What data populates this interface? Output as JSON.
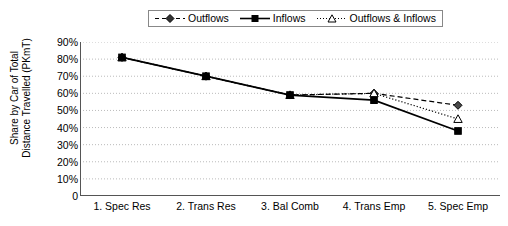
{
  "chart_data": {
    "type": "line",
    "title": "",
    "xlabel": "",
    "ylabel": "Share by Car of Total Distance Travelled (PKmT)",
    "ylabel_line1": "Share by Car of Total",
    "ylabel_line2": "Distance Travelled (PKmT)",
    "categories": [
      "1. Spec Res",
      "2. Trans Res",
      "3. Bal Comb",
      "4. Trans Emp",
      "5. Spec Emp"
    ],
    "ylim": [
      0,
      90
    ],
    "ytick_labels": [
      "0",
      "10%",
      "20%",
      "30%",
      "40%",
      "50%",
      "60%",
      "70%",
      "80%",
      "90%"
    ],
    "ytick_values": [
      0,
      10,
      20,
      30,
      40,
      50,
      60,
      70,
      80,
      90
    ],
    "grid": true,
    "grid_style": "dotted-horizontal",
    "legend_position": "top-center",
    "series": [
      {
        "name": "Outflows",
        "values": [
          81,
          70,
          59,
          60,
          53
        ],
        "marker": "diamond",
        "line_style": "dashed",
        "color": "#000000"
      },
      {
        "name": "Inflows",
        "values": [
          81,
          70,
          59,
          56,
          38
        ],
        "marker": "square-filled",
        "line_style": "solid",
        "color": "#000000"
      },
      {
        "name": "Outflows & Inflows",
        "values": [
          81,
          70,
          59,
          60,
          45
        ],
        "marker": "triangle-open",
        "line_style": "dotted",
        "color": "#000000"
      }
    ]
  },
  "legend": {
    "items": [
      {
        "label": "Outflows",
        "icon": "diamond-dashed-marker"
      },
      {
        "label": "Inflows",
        "icon": "square-solid-marker"
      },
      {
        "label": "Outflows & Inflows",
        "icon": "triangle-dotted-marker"
      }
    ]
  },
  "colors": {
    "axis": "#555555",
    "grid": "#bbbbbb",
    "series": "#000000",
    "background": "#ffffff",
    "legend_border": "#888888"
  }
}
